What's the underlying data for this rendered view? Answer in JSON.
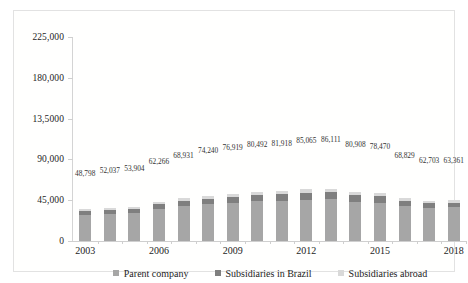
{
  "chart_data": {
    "type": "bar",
    "subtype": "stacked-column",
    "title": "",
    "xlabel": "",
    "ylabel": "",
    "grid": false,
    "legend_position": "bottom",
    "ylim": [
      0,
      225000
    ],
    "yticks": [
      0,
      45000,
      90000,
      135000,
      180000,
      225000
    ],
    "ytick_labels": [
      "0",
      "45,000",
      "90,000",
      "13,5000",
      "180,000",
      "225,000"
    ],
    "categories": [
      "2003",
      "2004",
      "2005",
      "2006",
      "2007",
      "2008",
      "2009",
      "2010",
      "2011",
      "2012",
      "2013",
      "2014",
      "2015",
      "2016",
      "2017",
      "2018"
    ],
    "xtick_labels_shown": [
      "2003",
      "2006",
      "2009",
      "2012",
      "2015",
      "2018"
    ],
    "totals": [
      48798,
      52037,
      53904,
      62266,
      68931,
      74240,
      76919,
      80492,
      81918,
      85065,
      86111,
      80908,
      78470,
      68829,
      62703,
      63361
    ],
    "total_labels": [
      "48,798",
      "52,037",
      "53,904",
      "62,266",
      "68,931",
      "74,240",
      "76,919",
      "80,492",
      "81,918",
      "85,065",
      "86,111",
      "80,908",
      "78,470",
      "68,829",
      "62,703",
      "63,361"
    ],
    "series": [
      {
        "name": "Parent company",
        "color": "#a6a6a6",
        "values": [
          28500,
          30000,
          30600,
          35400,
          38500,
          40300,
          41800,
          43600,
          44200,
          45600,
          45900,
          43500,
          42400,
          38800,
          36900,
          37200
        ]
      },
      {
        "name": "Subsidiaries in Brazil",
        "color": "#7f7f7f",
        "values": [
          4300,
          4600,
          4800,
          5400,
          6000,
          6600,
          6800,
          7300,
          7600,
          7900,
          8000,
          7300,
          6900,
          5800,
          5100,
          5200
        ]
      },
      {
        "name": "Subsidiaries abroad",
        "color": "#d9d9d9",
        "values": [
          2000,
          2200,
          2300,
          2600,
          2900,
          3200,
          3400,
          3600,
          3700,
          3900,
          4000,
          3700,
          3500,
          2900,
          2500,
          2500
        ]
      }
    ]
  },
  "legend": {
    "items": [
      {
        "label": "Parent company",
        "color": "#a6a6a6"
      },
      {
        "label": "Subsidiaries in Brazil",
        "color": "#7f7f7f"
      },
      {
        "label": "Subsidiaries abroad",
        "color": "#d9d9d9"
      }
    ]
  }
}
